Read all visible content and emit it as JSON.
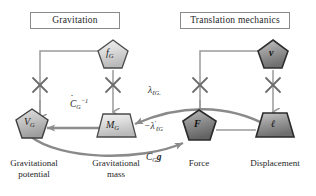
{
  "diagram": {
    "title_left": "Gravitation",
    "title_right": "Translation mechanics",
    "nodes": {
      "fg": {
        "symbol": "f",
        "sub": "G",
        "shape": "pentagon",
        "caption": ""
      },
      "v": {
        "symbol": "v",
        "sub": "",
        "shape": "pentagon",
        "caption": ""
      },
      "vg": {
        "symbol": "V",
        "sub": "G",
        "shape": "pentagon",
        "caption": "Gravitational\npotential"
      },
      "mg": {
        "symbol": "M",
        "sub": "G",
        "shape": "trapezoid",
        "caption": "Gravitational\nmass"
      },
      "f": {
        "symbol": "F",
        "sub": "",
        "shape": "pentagon",
        "caption": "Force"
      },
      "l": {
        "symbol": "ℓ",
        "sub": "",
        "shape": "trapezoid",
        "caption": "Displacement"
      }
    },
    "edges": {
      "c_inverse": {
        "base": "C",
        "hat": "^",
        "sub": "G",
        "sup": "−1",
        "text": "ĈG⁻¹"
      },
      "lambda_lg": {
        "text": "λ",
        "sub": "ℓG."
      },
      "neg_lambda_prime_lg": {
        "text": "−λ",
        "prime": "′",
        "sub": "ℓG"
      },
      "cg_g": {
        "base": "C",
        "sub": "G",
        "vector": "g"
      }
    },
    "junction_marks": [
      "cross",
      "cross",
      "cross",
      "cross"
    ],
    "colors": {
      "node_fill_light": "#d9d9d9",
      "node_fill_mid": "#b4b4b4",
      "node_fill_dark": "#8f8f8f",
      "node_stroke": "#3a3a3a",
      "line_gray": "#9a9a9a",
      "arrow_gray": "#8d8d8d",
      "curve_gray": "#8a8a8a",
      "box_border": "#8a8a8a",
      "text": "#262626",
      "background": "#ffffff"
    }
  }
}
